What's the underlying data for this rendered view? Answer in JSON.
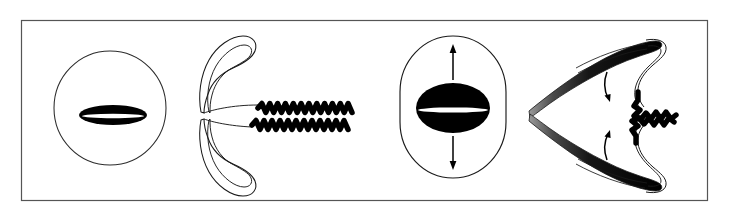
{
  "figure": {
    "title": "Sperm cell head shape and flagellar conformation comparison",
    "background_color": "#ffffff",
    "frame": {
      "stroke_color": "#555555",
      "fill_color": "#ffffff",
      "x": 21,
      "y": 20,
      "width": 686,
      "height": 180,
      "stroke_width": 1.2
    },
    "ink_color": "#000000",
    "outline_color": "#1a1a1a",
    "highlight_color": "#ffffff",
    "panel_count": 4
  },
  "panels": [
    {
      "id": "panel-1",
      "name": "head-face-view-normal",
      "label": "",
      "view": "en-face",
      "outline_shape": "circle",
      "outline": {
        "cx": 110,
        "cy": 108,
        "rx": 56,
        "ry": 57
      },
      "inner_body": {
        "name": "nucleus-lens-flat",
        "shape": "flat-ellipse",
        "cx": 113,
        "cy": 115,
        "rx": 34,
        "ry": 10,
        "fill": "#000000",
        "slit": {
          "cx": 113,
          "cy": 116,
          "rx": 31,
          "ry": 2.2,
          "fill": "#ffffff"
        }
      },
      "arrows": []
    },
    {
      "id": "panel-2",
      "name": "head-side-view-normal",
      "label": "",
      "view": "lateral",
      "outline_shape": "double-hook-pair",
      "hooks": [
        {
          "name": "upper-hook",
          "direction": "up"
        },
        {
          "name": "lower-hook",
          "direction": "down"
        }
      ],
      "flagella": [
        {
          "name": "flagellum-upper",
          "y": 108,
          "x_start": 258,
          "x_end": 352,
          "periods": 12,
          "amplitude": 4.5,
          "thickness": 5.5
        },
        {
          "name": "flagellum-lower",
          "y": 125,
          "x_start": 252,
          "x_end": 348,
          "periods": 12,
          "amplitude": 4.5,
          "thickness": 5.5
        }
      ],
      "arrows": []
    },
    {
      "id": "panel-3",
      "name": "head-face-view-swollen",
      "label": "",
      "view": "en-face",
      "outline_shape": "stadium",
      "outline": {
        "x": 400,
        "y": 36,
        "width": 106,
        "height": 142,
        "rx": 53,
        "ry": 56
      },
      "inner_body": {
        "name": "nucleus-ellipse-round",
        "shape": "ellipse",
        "cx": 453,
        "cy": 108,
        "rx": 37,
        "ry": 25,
        "fill": "#000000",
        "slit": {
          "cx": 453,
          "cy": 110,
          "rx": 35,
          "ry": 2.6,
          "fill": "#ffffff"
        }
      },
      "arrows": [
        {
          "name": "expansion-arrow-up",
          "direction": "up",
          "x": 453,
          "y_tail": 80,
          "y_head": 46
        },
        {
          "name": "expansion-arrow-down",
          "direction": "down",
          "x": 453,
          "y_tail": 136,
          "y_head": 170
        }
      ]
    },
    {
      "id": "panel-4",
      "name": "head-side-view-swollen",
      "label": "",
      "view": "lateral",
      "outline_shape": "tapered-wedge-pair",
      "wedges": [
        {
          "name": "upper-wedge",
          "direction": "up",
          "shading": "gradient-dark"
        },
        {
          "name": "lower-wedge",
          "direction": "down",
          "shading": "gradient-dark"
        }
      ],
      "flagella": [
        {
          "name": "flagellum-upper",
          "y": 108,
          "x_start": 616,
          "x_end": 676,
          "periods": 7,
          "amplitude": 5.0,
          "thickness": 5.5
        },
        {
          "name": "flagellum-lower",
          "y": 127,
          "x_start": 614,
          "x_end": 674,
          "periods": 7,
          "amplitude": 5.0,
          "thickness": 5.5
        }
      ],
      "arrows": [
        {
          "name": "curl-arrow-upper",
          "direction": "down-curve"
        },
        {
          "name": "curl-arrow-lower",
          "direction": "up-curve"
        }
      ]
    }
  ],
  "chart_data": {
    "type": "diagram",
    "categories": [
      "normal head en-face",
      "normal head lateral with flagella",
      "swollen head en-face",
      "swollen head lateral with flagella"
    ],
    "annotations": [
      "arrow up indicates vertical expansion",
      "arrow down indicates vertical expansion",
      "curved arrow indicates flagellar coiling"
    ],
    "legend": [],
    "xlabel": "",
    "ylabel": ""
  }
}
